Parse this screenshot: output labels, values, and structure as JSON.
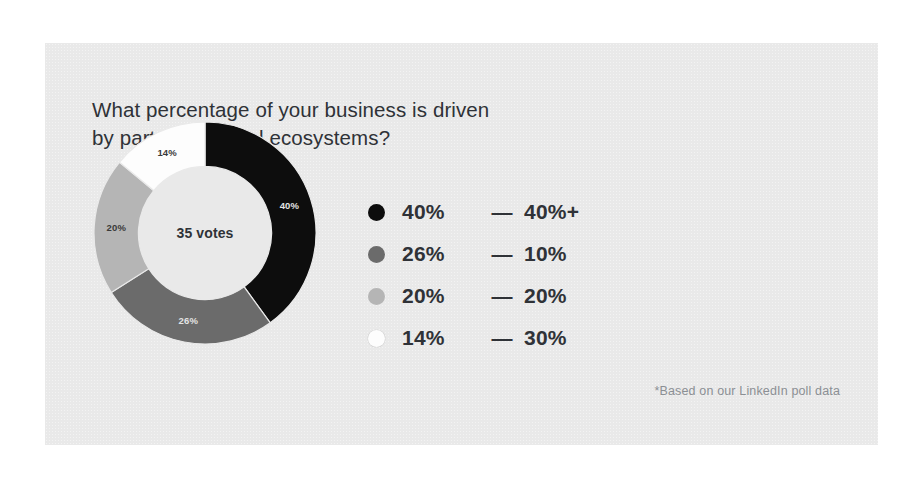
{
  "card": {
    "background_color": "#e9e9e9",
    "page_background_color": "#ffffff"
  },
  "title": {
    "line1": "What percentage of your business is driven",
    "line2": "by partner channel ecosystems?"
  },
  "donut": {
    "center_label": "35 votes",
    "total_votes": 35
  },
  "footnote": {
    "text": "*Based on our LinkedIn poll data"
  },
  "legend": {
    "rows": [
      {
        "share": "40%",
        "dash": "—",
        "bucket": "40%+",
        "color": "#0d0d0d"
      },
      {
        "share": "26%",
        "dash": "—",
        "bucket": "10%",
        "color": "#6b6b6b"
      },
      {
        "share": "20%",
        "dash": "—",
        "bucket": "20%",
        "color": "#b5b5b5"
      },
      {
        "share": "14%",
        "dash": "—",
        "bucket": "30%",
        "color": "#fdfdfd"
      }
    ]
  },
  "chart_data": {
    "type": "pie",
    "variant": "donut",
    "title": "What percentage of your business is driven by partner channel ecosystems?",
    "categories": [
      "40%+",
      "10%",
      "20%",
      "30%"
    ],
    "values": [
      40,
      26,
      20,
      14
    ],
    "value_unit": "percent",
    "data_labels": [
      "40%",
      "26%",
      "20%",
      "14%"
    ],
    "colors": [
      "#0d0d0d",
      "#6b6b6b",
      "#b5b5b5",
      "#fdfdfd"
    ],
    "center_label": "35 votes",
    "total_votes": 35,
    "start_angle_deg": 0,
    "direction": "clockwise",
    "hole_ratio": 0.6,
    "legend_position": "right",
    "grid": false,
    "annotation": "*Based on our LinkedIn poll data",
    "slices": [
      {
        "label": "40%+",
        "share_pct": 40,
        "data_label": "40%",
        "color": "#0d0d0d",
        "label_fill": "light"
      },
      {
        "label": "10%",
        "share_pct": 26,
        "data_label": "26%",
        "color": "#6b6b6b",
        "label_fill": "light"
      },
      {
        "label": "20%",
        "share_pct": 20,
        "data_label": "20%",
        "color": "#b5b5b5",
        "label_fill": "dark"
      },
      {
        "label": "30%",
        "share_pct": 14,
        "data_label": "14%",
        "color": "#fdfdfd",
        "label_fill": "dark"
      }
    ]
  }
}
